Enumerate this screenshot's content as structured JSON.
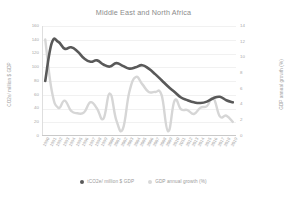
{
  "chart_data": {
    "type": "line",
    "title": "Middle East and North Africa",
    "xlabel": "",
    "ylabel": "CO2e/ million $ GDP",
    "y2label": "GDP annual growth (%)",
    "ylim": [
      0,
      160
    ],
    "y2lim": [
      0,
      14
    ],
    "grid": true,
    "legend_position": "bottom",
    "yticks": [
      "0",
      "20",
      "40",
      "60",
      "80",
      "100",
      "120",
      "140",
      "160"
    ],
    "y2ticks": [
      "0",
      "2",
      "4",
      "6",
      "8",
      "10",
      "12",
      "14"
    ],
    "categories": [
      "1990",
      "1991",
      "1992",
      "1993",
      "1994",
      "1995",
      "1996",
      "1997",
      "1998",
      "1999",
      "2000",
      "2001",
      "2002",
      "2003",
      "2004",
      "2005",
      "2006",
      "2007",
      "2008",
      "2009",
      "2010",
      "2011",
      "2012",
      "2013",
      "2014",
      "2015",
      "2016",
      "2017",
      "2018",
      "2019"
    ],
    "series": [
      {
        "name": "tCO2e/ million $ GDP",
        "axis": "left",
        "color": "#595959",
        "values": [
          80,
          135,
          137,
          127,
          129,
          123,
          113,
          108,
          110,
          104,
          101,
          106,
          102,
          98,
          100,
          103,
          98,
          90,
          81,
          72,
          64,
          56,
          52,
          49,
          48,
          50,
          55,
          57,
          52,
          49
        ]
      },
      {
        "name": "GDP annual growth (%)",
        "axis": "right",
        "color": "#d6d6d6",
        "values": [
          12.3,
          5.8,
          3.6,
          4.5,
          3.2,
          2.9,
          3.0,
          4.3,
          3.5,
          2.2,
          5.4,
          2.0,
          0.9,
          5.6,
          7.5,
          6.6,
          5.6,
          5.6,
          5.2,
          0.6,
          4.5,
          3.4,
          3.3,
          2.8,
          3.6,
          3.8,
          4.8,
          2.5,
          2.6,
          1.8
        ]
      }
    ]
  },
  "legend": {
    "items": [
      {
        "label": "tCO2e/ million $ GDP",
        "color": "#595959"
      },
      {
        "label": "GDP annual growth (%)",
        "color": "#d9d9d9"
      }
    ]
  }
}
